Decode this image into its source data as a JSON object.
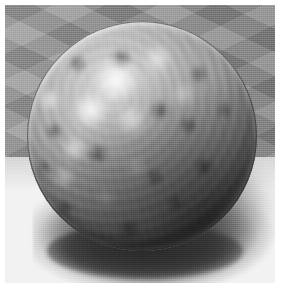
{
  "scene": {
    "title": "Rendered chrome sphere on checkerboard floor",
    "description": "A glossy, mottled reflective sphere resting on a perspective checkerboard floor in front of a faceted gray wall, with a soft dark cast shadow falling to the lower right.",
    "width": 281,
    "height": 292,
    "caption": ""
  },
  "objects": {
    "sphere": {
      "name": "reflective-sphere",
      "label": "Chrome sphere",
      "material": "blurred mirror / brushed chrome",
      "center_x": 137,
      "center_y": 131,
      "radius": 115,
      "base_color": "#9d9d9d",
      "highlight_color": "#ffffff",
      "shadow_color": "#3a3a3a",
      "rim_highlight": "upper-left arc"
    },
    "floor": {
      "name": "checkerboard-floor",
      "label": "Checkerboard floor",
      "light_tile_color": "#f2f2f2",
      "dark_tile_color": "#c6c6c6",
      "horizon_y": 152,
      "pattern": "diamond checker in perspective"
    },
    "wall": {
      "name": "faceted-wall",
      "label": "Faceted gray backdrop",
      "base_color": "#919191",
      "light_facet_color": "#9e9e9e",
      "dark_facet_color": "#858585",
      "pattern": "rhombus facets"
    },
    "shadow": {
      "name": "cast-shadow",
      "label": "Cast shadow",
      "color": "#4a4a4a",
      "direction": "down-right",
      "softness": "soft-penumbra"
    }
  },
  "frame": {
    "name": "white-margin",
    "border_color": "#ffffff",
    "margin_px": 5
  }
}
